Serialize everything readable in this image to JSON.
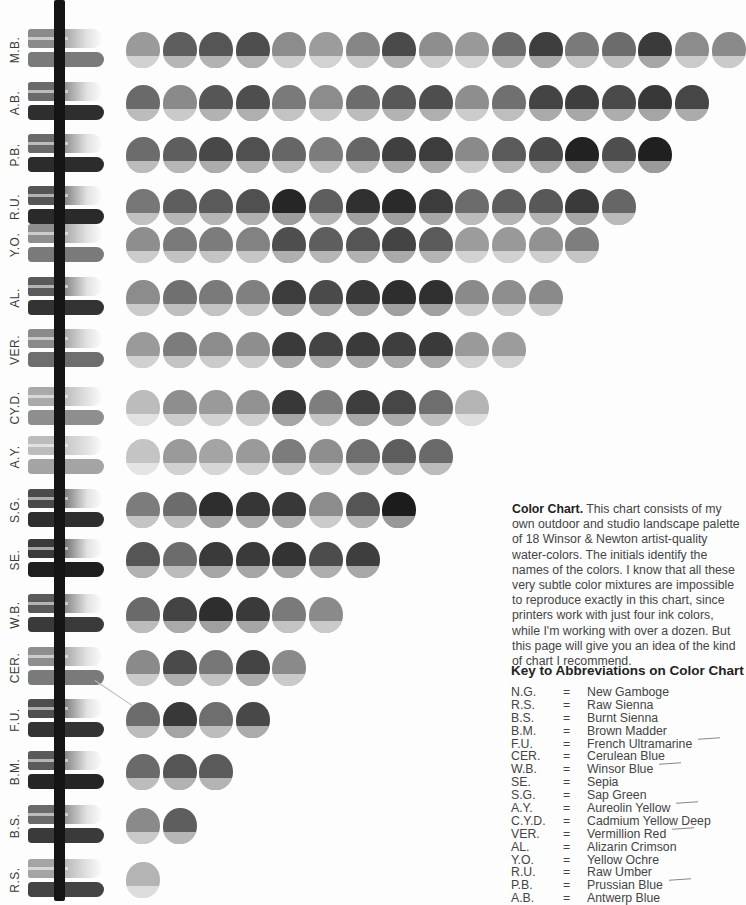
{
  "chart": {
    "rows": [
      {
        "label": "M.B.",
        "wash": "#8a8a8a",
        "solid": "#7a7a7a",
        "dots": [
          "#9a9a9a",
          "#5e5e5e",
          "#555",
          "#4e4e4e",
          "#8c8c8c",
          "#9c9c9c",
          "#868686",
          "#4a4a4a",
          "#8e8e8e",
          "#999",
          "#6a6a6a",
          "#3e3e3e",
          "#7a7a7a",
          "#6c6c6c",
          "#3a3a3a",
          "#8c8c8c",
          "#8a8a8a"
        ]
      },
      {
        "label": "A.B.",
        "wash": "#6a6a6a",
        "solid": "#2e2e2e",
        "dots": [
          "#6a6a6a",
          "#8a8a8a",
          "#565656",
          "#4e4e4e",
          "#7a7a7a",
          "#8c8c8c",
          "#6c6c6c",
          "#585858",
          "#4e4e4e",
          "#8e8e8e",
          "#707070",
          "#444",
          "#3e3e3e",
          "#4a4a4a",
          "#383838",
          "#464646"
        ]
      },
      {
        "label": "P.B.",
        "wash": "#6a6a6a",
        "solid": "#2c2c2c",
        "dots": [
          "#6c6c6c",
          "#5e5e5e",
          "#484848",
          "#505050",
          "#666",
          "#7c7c7c",
          "#666",
          "#404040",
          "#3c3c3c",
          "#8a8a8a",
          "#5a5a5a",
          "#4a4a4a",
          "#222",
          "#4e4e4e",
          "#202020"
        ]
      },
      {
        "label": "R.U.",
        "wash": "#555",
        "solid": "#2a2a2a",
        "dots": [
          "#777",
          "#5e5e5e",
          "#5a5a5a",
          "#505050",
          "#262626",
          "#5e5e5e",
          "#303030",
          "#2a2a2a",
          "#3c3c3c",
          "#6c6c6c",
          "#5e5e5e",
          "#585858",
          "#3a3a3a",
          "#666"
        ]
      },
      {
        "label": "Y.O.",
        "wash": "#8e8e8e",
        "solid": "#7a7a7a",
        "dots": [
          "#8e8e8e",
          "#7a7a7a",
          "#7c7c7c",
          "#828282",
          "#4e4e4e",
          "#5e5e5e",
          "#555",
          "#444",
          "#5a5a5a",
          "#9c9c9c",
          "#999",
          "#929292",
          "#7e7e7e"
        ]
      },
      {
        "label": "AL.",
        "wash": "#5a5a5a",
        "solid": "#333",
        "dots": [
          "#8c8c8c",
          "#707070",
          "#7a7a7a",
          "#808080",
          "#3c3c3c",
          "#4a4a4a",
          "#383838",
          "#2e2e2e",
          "#303030",
          "#8a8a8a",
          "#8e8e8e",
          "#8a8a8a"
        ]
      },
      {
        "label": "VER.",
        "wash": "#8a8a8a",
        "solid": "#6e6e6e",
        "dots": [
          "#9a9a9a",
          "#7c7c7c",
          "#8c8c8c",
          "#8e8e8e",
          "#3a3a3a",
          "#444",
          "#3a3a3a",
          "#3e3e3e",
          "#3a3a3a",
          "#9a9a9a",
          "#9c9c9c"
        ]
      },
      {
        "label": "CY.D.",
        "wash": "#aaa",
        "solid": "#8e8e8e",
        "dots": [
          "#bcbcbc",
          "#8e8e8e",
          "#9a9a9a",
          "#929292",
          "#383838",
          "#7e7e7e",
          "#3e3e3e",
          "#464646",
          "#6e6e6e",
          "#b4b4b4"
        ]
      },
      {
        "label": "A.Y.",
        "wash": "#bcbcbc",
        "solid": "#a4a4a4",
        "dots": [
          "#c4c4c4",
          "#9a9a9a",
          "#a4a4a4",
          "#9a9a9a",
          "#7c7c7c",
          "#8e8e8e",
          "#6e6e6e",
          "#5e5e5e",
          "#6a6a6a"
        ]
      },
      {
        "label": "S.G.",
        "wash": "#4a4a4a",
        "solid": "#2e2e2e",
        "dots": [
          "#7c7c7c",
          "#6c6c6c",
          "#2e2e2e",
          "#363636",
          "#383838",
          "#8c8c8c",
          "#555",
          "#1c1c1c"
        ]
      },
      {
        "label": "SE.",
        "wash": "#3a3a3a",
        "solid": "#1e1e1e",
        "dots": [
          "#555",
          "#6c6c6c",
          "#3a3a3a",
          "#3a3a3a",
          "#333",
          "#4c4c4c",
          "#3e3e3e"
        ]
      },
      {
        "label": "W.B.",
        "wash": "#5a5a5a",
        "solid": "#3a3a3a",
        "dots": [
          "#6a6a6a",
          "#444",
          "#2e2e2e",
          "#3a3a3a",
          "#7a7a7a",
          "#8a8a8a"
        ]
      },
      {
        "label": "CER.",
        "wash": "#8e8e8e",
        "solid": "#7a7a7a",
        "dots": [
          "#8a8a8a",
          "#4a4a4a",
          "#777",
          "#444",
          "#8a8a8a"
        ]
      },
      {
        "label": "F.U.",
        "wash": "#4e4e4e",
        "solid": "#333",
        "dots": [
          "#6c6c6c",
          "#383838",
          "#6e6e6e",
          "#484848"
        ]
      },
      {
        "label": "B.M.",
        "wash": "#5a5a5a",
        "solid": "#252525",
        "dots": [
          "#6a6a6a",
          "#555",
          "#5a5a5a"
        ]
      },
      {
        "label": "B.S.",
        "wash": "#6a6a6a",
        "solid": "#3a3a3a",
        "dots": [
          "#8a8a8a",
          "#5e5e5e"
        ]
      },
      {
        "label": "R.S.",
        "wash": "#a4a4a4",
        "solid": "#444",
        "dots": [
          "#b4b4b4"
        ]
      }
    ],
    "row_centers_y": [
      50,
      103,
      155,
      207,
      245,
      298,
      350,
      408,
      457,
      510,
      560,
      615,
      668,
      720,
      772,
      826,
      880
    ]
  },
  "description": {
    "heading": "Color Chart.",
    "body": " This chart consists of my own outdoor and studio landscape palette of 18 Winsor & Newton artist-quality water-colors. The initials identify the names of the colors. I know that all these very subtle color mixtures are impossible to reproduce exactly in this chart, since printers work with just four ink colors, while I'm working with over a dozen. But this page will give you an idea of the kind of chart I recommend."
  },
  "key": {
    "title": "Key to Abbreviations on Color Chart",
    "items": [
      {
        "abbr": "N.G.",
        "name": "New Gamboge",
        "tick": false
      },
      {
        "abbr": "R.S.",
        "name": "Raw Sienna",
        "tick": false
      },
      {
        "abbr": "B.S.",
        "name": "Burnt Sienna",
        "tick": false
      },
      {
        "abbr": "B.M.",
        "name": "Brown Madder",
        "tick": false
      },
      {
        "abbr": "F.U.",
        "name": "French Ultramarine",
        "tick": true
      },
      {
        "abbr": "CER.",
        "name": "Cerulean Blue",
        "tick": false
      },
      {
        "abbr": "W.B.",
        "name": "Winsor Blue",
        "tick": true
      },
      {
        "abbr": "SE.",
        "name": "Sepia",
        "tick": false
      },
      {
        "abbr": "S.G.",
        "name": "Sap Green",
        "tick": false
      },
      {
        "abbr": "A.Y.",
        "name": "Aureolin Yellow",
        "tick": true
      },
      {
        "abbr": "C.Y.D.",
        "name": "Cadmium Yellow Deep",
        "tick": false
      },
      {
        "abbr": "VER.",
        "name": "Vermillion Red",
        "tick": true
      },
      {
        "abbr": "AL.",
        "name": "Alizarin Crimson",
        "tick": false
      },
      {
        "abbr": "Y.O.",
        "name": "Yellow Ochre",
        "tick": false
      },
      {
        "abbr": "R.U.",
        "name": "Raw Umber",
        "tick": false
      },
      {
        "abbr": "P.B.",
        "name": "Prussian Blue",
        "tick": true
      },
      {
        "abbr": "A.B.",
        "name": "Antwerp Blue",
        "tick": false
      }
    ],
    "equals": "="
  }
}
